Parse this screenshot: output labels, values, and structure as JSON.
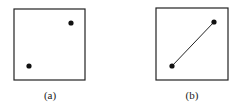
{
  "panels": [
    {
      "label": "(a)",
      "box": {
        "x": 14,
        "y": 9,
        "w": 71,
        "h": 71
      },
      "points": [
        [
          29,
          66
        ],
        [
          71,
          23
        ]
      ],
      "connected": false
    },
    {
      "label": "(b)",
      "box": {
        "x": 156,
        "y": 8,
        "w": 72,
        "h": 72
      },
      "points": [
        [
          172,
          66
        ],
        [
          214,
          22
        ]
      ],
      "connected": true
    }
  ],
  "colors": {
    "stroke": "#222222",
    "dot": "#111111"
  }
}
